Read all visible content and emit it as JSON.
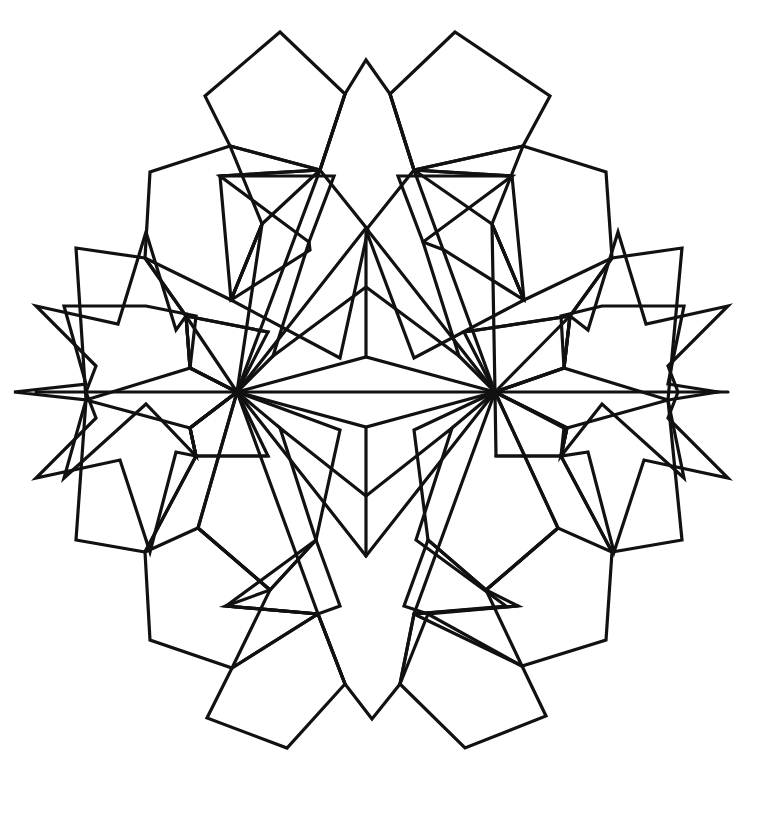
{
  "document": {
    "kind": "line-art-coloring-page",
    "title": "Geometric Star Mandala",
    "canvas": {
      "width": 763,
      "height": 813
    },
    "background_color": "#ffffff",
    "stroke_color": "#111111",
    "stroke_width": 3.2,
    "fill": "none",
    "symmetry": "bilateral (left-right mirror about x = 366)",
    "mirror_axis_x": 366,
    "center": {
      "x": 366,
      "y": 392
    }
  },
  "motifs": [
    {
      "name": "top-star",
      "type": "five-point-star",
      "orientation": "point-up",
      "tip": {
        "x": 366,
        "y": 60
      }
    },
    {
      "name": "bottom-star",
      "type": "five-point-star",
      "orientation": "point-down",
      "tip": {
        "x": 372,
        "y": 719
      }
    },
    {
      "name": "left-star",
      "type": "five-point-star",
      "orientation": "point-left",
      "tip": {
        "x": 14,
        "y": 392
      }
    },
    {
      "name": "right-star",
      "type": "five-point-star",
      "orientation": "point-right",
      "tip": {
        "x": 718,
        "y": 392
      }
    },
    {
      "name": "upper-cube",
      "type": "isometric-cube",
      "apex": {
        "x": 366,
        "y": 228
      }
    },
    {
      "name": "lower-cube",
      "type": "isometric-cube",
      "apex": {
        "x": 366,
        "y": 556
      }
    },
    {
      "name": "left-hub",
      "type": "vertex-hub",
      "position": {
        "x": 237,
        "y": 392
      },
      "spokes": 8
    },
    {
      "name": "right-hub",
      "type": "vertex-hub",
      "position": {
        "x": 495,
        "y": 392
      },
      "spokes": 8
    },
    {
      "name": "outer-pentagon-ring",
      "type": "pentagon-tiling-ring",
      "count": 10
    },
    {
      "name": "inner-pentagon-ring",
      "type": "pentagon-tiling-ring",
      "count": 10
    }
  ],
  "geometry": {
    "outer_boundary": "M 366 60 L 345 94 L 280 32 L 205 96 L 230 146 L 150 172 L 145 258 L 76 248 L 14 392 L 76 540 L 145 552 L 150 640 L 232 668 L 207 718 L 287 748 L 345 684 L 372 719 L 400 684 L 465 748 L 546 716 L 522 666 L 606 640 L 612 552 L 682 540 L 718 392 L 682 248 L 612 258 L 606 172 L 523 146 L 550 96 L 455 32 L 390 94 Z",
    "paths": [
      {
        "id": "top-star",
        "d": "M 366 60 L 398 176 L 512 176 L 423 242 L 459 356 L 366 287 L 273 356 L 309 242 L 220 176 L 334 176 Z"
      },
      {
        "id": "bottom-star",
        "d": "M 372 719 L 340 606 L 226 606 L 316 540 L 280 428 L 372 496 L 464 428 L 428 540 L 518 606 L 404 606 Z"
      },
      {
        "id": "left-star",
        "d": "M 14 392 L 96 356 L 58 304 L 124 310 L 162 228 L 186 316 L 268 332 L 190 368 L 196 456 L 146 404 L 64 478 L 86 400 Z"
      },
      {
        "id": "right-star",
        "d": "M 718 392 L 636 356 L 674 304 L 608 310 L 570 228 L 546 316 L 464 332 L 542 368 L 536 456 L 586 404 L 668 478 L 646 400 Z"
      },
      {
        "id": "upper-cube",
        "d": "M 366 228 L 237 392 L 366 357 L 495 392 Z M 366 228 L 366 357"
      },
      {
        "id": "lower-cube",
        "d": "M 366 556 L 237 392 L 366 427 L 495 392 Z M 366 556 L 366 427"
      },
      {
        "id": "mid-axis",
        "d": "M 14 392 L 718 392"
      }
    ]
  },
  "palette": {
    "line": "#111111",
    "paper": "#ffffff"
  }
}
